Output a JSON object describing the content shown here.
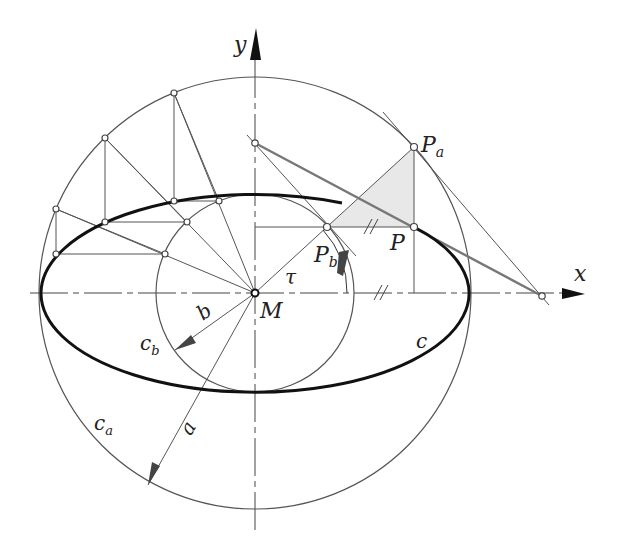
{
  "diagram": {
    "center": {
      "label": "M",
      "x": 255,
      "y": 293
    },
    "outer_circle": {
      "label": "c_a",
      "radius": 216
    },
    "inner_circle": {
      "label": "c_b",
      "radius": 99
    },
    "ellipse": {
      "label": "c",
      "semi_major": 214,
      "semi_minor": 99
    },
    "axes": {
      "x_label": "x",
      "y_label": "y"
    },
    "radius_labels": {
      "a": "a",
      "b": "b"
    },
    "angle": {
      "label": "τ",
      "degrees": 42
    },
    "points": {
      "Pa": {
        "label": "P",
        "sub": "a"
      },
      "Pb": {
        "label": "P",
        "sub": "b"
      },
      "P": {
        "label": "P"
      }
    },
    "construction_angles_deg": [
      112,
      134,
      157
    ],
    "parallel_mark": "//",
    "colors": {
      "ellipse": "#111111",
      "circles": "#555555",
      "construction": "#666666",
      "shade": "#e8e8e8",
      "tangent_thick": "#777777"
    }
  },
  "labels": {
    "y": "y",
    "x": "x",
    "M": "M",
    "tau": "τ",
    "Pa_main": "P",
    "Pa_sub": "a",
    "Pb_main": "P",
    "Pb_sub": "b",
    "P": "P",
    "b": "b",
    "a": "a",
    "cb_main": "c",
    "cb_sub": "b",
    "ca_main": "c",
    "ca_sub": "a",
    "c": "c"
  }
}
